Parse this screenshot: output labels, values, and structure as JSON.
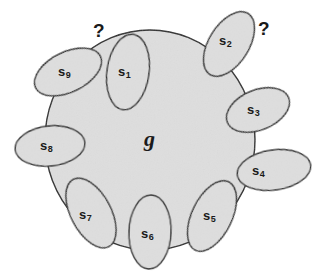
{
  "figure": {
    "kind": "set-diagram",
    "background": "#ffffff",
    "fill": "#dedede",
    "stroke": "#2b2b2b",
    "center": {
      "label": "g",
      "cx": 150,
      "cy": 140,
      "rx": 105,
      "ry": 110,
      "label_x": 144,
      "label_y": 126
    },
    "questions": [
      {
        "name": "question-mark-left",
        "text": "?",
        "x": 93,
        "y": 20
      },
      {
        "name": "question-mark-right",
        "text": "?",
        "x": 258,
        "y": 18
      }
    ],
    "nodes": [
      {
        "id": "s1",
        "label": "s",
        "sub": "1",
        "cx": 128,
        "cy": 72,
        "rx": 21,
        "ry": 38,
        "rot": 8,
        "label_x": 118,
        "label_y": 64
      },
      {
        "id": "s2",
        "label": "s",
        "sub": "2",
        "cx": 229,
        "cy": 44,
        "rx": 20,
        "ry": 36,
        "rot": 32,
        "label_x": 219,
        "label_y": 33
      },
      {
        "id": "s3",
        "label": "s",
        "sub": "3",
        "cx": 258,
        "cy": 110,
        "rx": 33,
        "ry": 20,
        "rot": -22,
        "label_x": 247,
        "label_y": 102
      },
      {
        "id": "s4",
        "label": "s",
        "sub": "4",
        "cx": 274,
        "cy": 170,
        "rx": 37,
        "ry": 20,
        "rot": -8,
        "label_x": 252,
        "label_y": 163
      },
      {
        "id": "s5",
        "label": "s",
        "sub": "5",
        "cx": 212,
        "cy": 216,
        "rx": 20,
        "ry": 38,
        "rot": 26,
        "label_x": 203,
        "label_y": 208
      },
      {
        "id": "s6",
        "label": "s",
        "sub": "6",
        "cx": 150,
        "cy": 232,
        "rx": 21,
        "ry": 37,
        "rot": 2,
        "label_x": 141,
        "label_y": 226
      },
      {
        "id": "s7",
        "label": "s",
        "sub": "7",
        "cx": 91,
        "cy": 213,
        "rx": 20,
        "ry": 38,
        "rot": -28,
        "label_x": 79,
        "label_y": 207
      },
      {
        "id": "s8",
        "label": "s",
        "sub": "8",
        "cx": 50,
        "cy": 146,
        "rx": 35,
        "ry": 20,
        "rot": -6,
        "label_x": 40,
        "label_y": 138
      },
      {
        "id": "s9",
        "label": "s",
        "sub": "9",
        "cx": 68,
        "cy": 72,
        "rx": 36,
        "ry": 20,
        "rot": -26,
        "label_x": 58,
        "label_y": 64
      }
    ]
  }
}
